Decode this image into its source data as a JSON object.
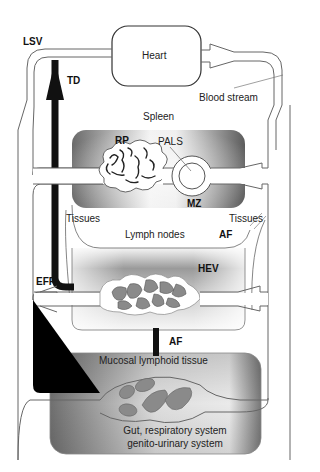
{
  "diagram": {
    "nodes": {
      "heart": "Heart",
      "spleen": "Spleen",
      "lymph_nodes": "Lymph nodes",
      "mucosal": "Mucosal lymphoid tissue",
      "gut_line1": "Gut, respiratory system",
      "gut_line2": "genito-urinary system"
    },
    "labels": {
      "lsv": "LSV",
      "td": "TD",
      "blood_stream": "Blood stream",
      "rp": "RP",
      "pals": "PALS",
      "mz": "MZ",
      "tissues_left": "Tissues",
      "tissues_right": "Tissues",
      "af_top": "AF",
      "hev": "HEV",
      "eff": "EFF",
      "af_bottom": "AF"
    },
    "colors": {
      "outline": "#555555",
      "thoracic_duct": "#111111",
      "organ_dark": "#6e6e6e",
      "organ_light": "#f4f4f4",
      "cell_fill": "#8a8a8a"
    }
  }
}
